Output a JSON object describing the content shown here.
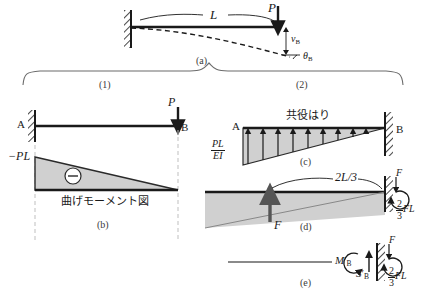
{
  "figure": {
    "title_note": "Cantilever beam deflection by conjugate beam method",
    "colors": {
      "line": "#1a1a1a",
      "fill": "#d0d0d0",
      "fill_stroke": "#2a2a2a",
      "dashed_guide": "#bfbfbf",
      "brace": "#6b6b6b",
      "tag": "#3a3a3a"
    }
  },
  "panel_a": {
    "tag": "(a)",
    "length_label": "L",
    "load_label": "P",
    "deflection_label": "v",
    "deflection_sub": "B",
    "rotation_label": "θ",
    "rotation_sub": "B"
  },
  "brace": {
    "left_tag": "(1)",
    "right_tag": "(2)"
  },
  "panel_beam_left": {
    "support_label": "A",
    "free_end_label": "B",
    "load_label": "P"
  },
  "panel_b": {
    "tag": "(b)",
    "moment_label": "−PL",
    "sign_symbol": "−",
    "caption": "曲げモーメント図"
  },
  "panel_c": {
    "tag": "(c)",
    "support_label": "A",
    "wall_label": "B",
    "caption": "共役はり",
    "load_num": "PL",
    "load_den": "EI"
  },
  "panel_d": {
    "tag": "(d)",
    "dimension_label": "2L/3",
    "resultant_label": "F",
    "shear_label": "F",
    "moment_num": "2",
    "moment_den": "3",
    "moment_unit": "FL"
  },
  "panel_e": {
    "tag": "(e)",
    "moment_reaction": "M",
    "moment_reaction_prime": "′",
    "moment_reaction_sub": "B",
    "shear_reaction": "S",
    "shear_reaction_prime": "′",
    "shear_reaction_sub": "B",
    "force_label": "F",
    "moment_num": "2",
    "moment_den": "3",
    "moment_unit": "FL"
  }
}
